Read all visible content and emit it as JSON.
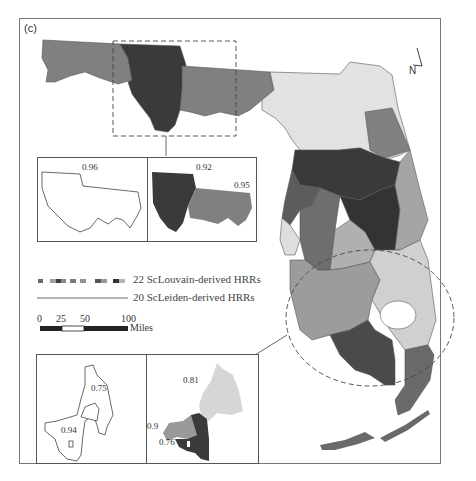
{
  "panel_label": "(c)",
  "north_arrow": {
    "label": "N"
  },
  "legend": {
    "louvain_label": "22 ScLouvain-derived HRRs",
    "leiden_label": "20 ScLeiden-derived HRRs",
    "swatch_colors": [
      "#6b6b6b",
      "#a0a0a0",
      "#3e3e3e",
      "#8a8a8a",
      "#c2c2c2",
      "#555555",
      "#9a9a9a",
      "#333333",
      "#b5b5b5"
    ]
  },
  "scale_bar": {
    "ticks": [
      "0",
      "25",
      "50",
      "100"
    ],
    "unit": "Miles"
  },
  "insets": {
    "panhandle_leiden": {
      "value": "0.96"
    },
    "panhandle_louvain": {
      "values": [
        "0.92",
        "0.95"
      ]
    },
    "south_leiden": {
      "values": [
        "0.75",
        "0.94"
      ]
    },
    "south_louvain": {
      "values": [
        "0.81",
        "0.9",
        "0.76"
      ]
    }
  },
  "colors": {
    "dark": "#3a3a3a",
    "mid_dark": "#5c5c5c",
    "mid": "#808080",
    "light_mid": "#a5a5a5",
    "light": "#d6d6d6",
    "border": "#555555"
  }
}
